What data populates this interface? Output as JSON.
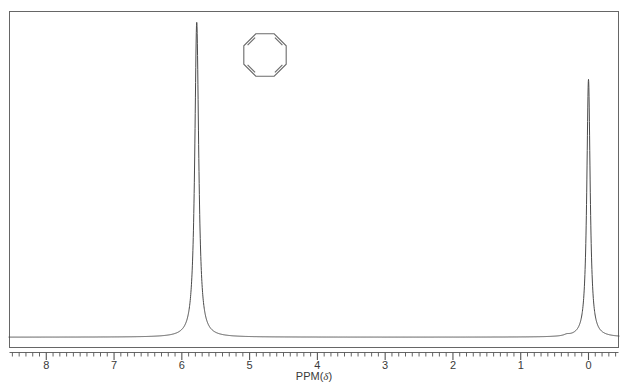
{
  "figure": {
    "kind": "nmr-spectrum",
    "background_color": "#ffffff",
    "frame_color": "#555555",
    "trace_color": "#4a4a4a",
    "axis_color": "#555555",
    "label_color": "#3a3a3a"
  },
  "axis": {
    "title": "PPM(",
    "title_symbol": "δ",
    "title_close": ")",
    "title_full": "PPM(δ)",
    "tick_labels": [
      "8",
      "7",
      "6",
      "5",
      "4",
      "3",
      "2",
      "1",
      "0"
    ],
    "tick_values": [
      8,
      7,
      6,
      5,
      4,
      3,
      2,
      1,
      0
    ],
    "minor_ticks_per_major": 10,
    "direction": "decreasing-left-to-right"
  },
  "structure": {
    "name": "cyclooctatetraene-structure",
    "shape": "octagon",
    "double_bond_count": 4,
    "stroke_color": "#6b6b6b"
  },
  "chart_data": {
    "type": "line",
    "title": "",
    "subtitle": "",
    "xlabel": "PPM(δ)",
    "ylabel": "",
    "xlim": [
      8.55,
      -0.45
    ],
    "ylim": [
      0,
      100
    ],
    "grid": false,
    "legend": "none",
    "x_tick_labels": [
      "8",
      "7",
      "6",
      "5",
      "4",
      "3",
      "2",
      "1",
      "0"
    ],
    "x_ticks": [
      8,
      7,
      6,
      5,
      4,
      3,
      2,
      1,
      0
    ],
    "annotations": [
      {
        "label": "cyclooctatetraene ring structure",
        "x_ppm": 4.5,
        "y_rel": 0.88
      }
    ],
    "peaks": [
      {
        "id": "vinyl-peak",
        "ppm": 5.78,
        "relative_height": 100,
        "half_width_ppm": 0.035,
        "assignment": "ring CH"
      },
      {
        "id": "tms-peak",
        "ppm": 0.0,
        "relative_height": 82,
        "half_width_ppm": 0.03,
        "assignment": "TMS reference"
      },
      {
        "id": "impurity-bump",
        "ppm": 0.32,
        "relative_height": 1.6,
        "half_width_ppm": 0.05,
        "assignment": "minor impurity"
      }
    ],
    "baseline_relative": 1.2,
    "series": [
      {
        "name": "1H NMR trace",
        "color": "#4a4a4a",
        "x": [
          8.55,
          8.0,
          7.0,
          6.2,
          5.9,
          5.82,
          5.78,
          5.74,
          5.66,
          5.4,
          4.5,
          3.0,
          1.5,
          0.5,
          0.36,
          0.32,
          0.28,
          0.1,
          0.03,
          0.0,
          -0.03,
          -0.1,
          -0.45
        ],
        "y": [
          1.0,
          1.1,
          1.2,
          1.3,
          1.5,
          30,
          100,
          30,
          2.0,
          1.5,
          1.4,
          1.3,
          1.2,
          1.2,
          1.3,
          2.8,
          1.3,
          1.4,
          28,
          82,
          28,
          1.6,
          1.4
        ]
      }
    ]
  },
  "plot_area": {
    "left_px": 9,
    "top_px": 11,
    "right_px": 619,
    "bottom_px": 348
  }
}
